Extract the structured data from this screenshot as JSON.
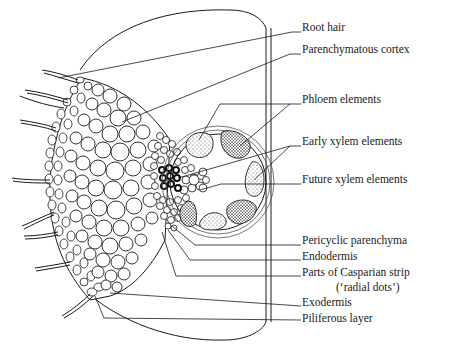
{
  "figure": {
    "colors": {
      "line": "#1a1a1a",
      "background": "#ffffff",
      "stipple": "#555555"
    }
  },
  "labels": [
    {
      "id": "root-hair",
      "text": "Root hair",
      "x": 302,
      "y": 27
    },
    {
      "id": "parenchymatous-cortex",
      "text": "Parenchymatous cortex",
      "x": 302,
      "y": 48
    },
    {
      "id": "phloem-elements",
      "text": "Phloem elements",
      "x": 302,
      "y": 97
    },
    {
      "id": "early-xylem-elements",
      "text": "Early xylem elements",
      "x": 302,
      "y": 142
    },
    {
      "id": "future-xylem-elements",
      "text": "Future xylem elements",
      "x": 302,
      "y": 179
    },
    {
      "id": "pericyclic-parenchyma",
      "text": "Pericyclic parenchyma",
      "x": 302,
      "y": 240
    },
    {
      "id": "endodermis",
      "text": "Endodermis",
      "x": 302,
      "y": 256
    },
    {
      "id": "casparian-strip",
      "text": "Parts of Casparian strip",
      "x": 302,
      "y": 272
    },
    {
      "id": "casparian-strip-sub",
      "text": "(‘radial dots’)",
      "x": 340,
      "y": 287
    },
    {
      "id": "exodermis",
      "text": "Exodermis",
      "x": 302,
      "y": 302
    },
    {
      "id": "piliferous-layer",
      "text": "Piliferous layer",
      "x": 302,
      "y": 317
    }
  ]
}
